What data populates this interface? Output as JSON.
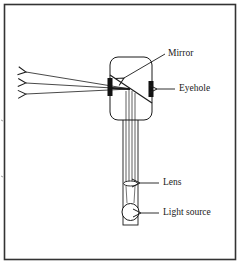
{
  "diagram": {
    "type": "labeled schematic",
    "labels": {
      "mirror": "Mirror",
      "eyehole": "Eyehole",
      "lens": "Lens",
      "light_source": "Light source"
    },
    "components": [
      {
        "id": "housing",
        "shape": "rounded-rectangle"
      },
      {
        "id": "mirror",
        "shape": "diagonal-line"
      },
      {
        "id": "front-aperture",
        "shape": "black-bar"
      },
      {
        "id": "eyehole",
        "shape": "black-bar"
      },
      {
        "id": "tube",
        "shape": "rectangle"
      },
      {
        "id": "lens",
        "shape": "ellipse"
      },
      {
        "id": "light-source",
        "shape": "circle"
      },
      {
        "id": "emitted-rays",
        "count": 3,
        "direction": "left"
      }
    ],
    "colors": {
      "stroke": "#1a1a1a",
      "frame": "#333333",
      "background": "#ffffff"
    }
  }
}
